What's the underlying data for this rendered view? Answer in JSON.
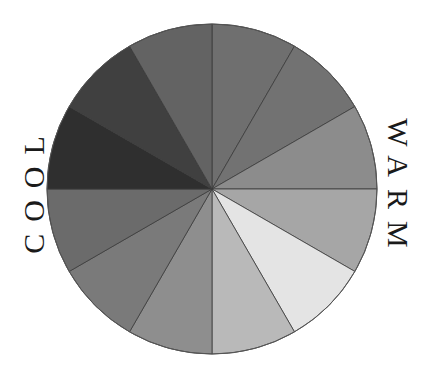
{
  "diagram": {
    "type": "color-wheel",
    "center": [
      212,
      189
    ],
    "radius": 165,
    "segment_count": 12,
    "stroke_color": "#3a3a3a",
    "segments": [
      {
        "index": 0,
        "start_deg": 0,
        "end_deg": 30,
        "color": "#6f6f6f"
      },
      {
        "index": 1,
        "start_deg": 30,
        "end_deg": 60,
        "color": "#727272"
      },
      {
        "index": 2,
        "start_deg": 60,
        "end_deg": 90,
        "color": "#8c8c8c"
      },
      {
        "index": 3,
        "start_deg": 90,
        "end_deg": 120,
        "color": "#a6a6a6"
      },
      {
        "index": 4,
        "start_deg": 120,
        "end_deg": 150,
        "color": "#e4e4e4"
      },
      {
        "index": 5,
        "start_deg": 150,
        "end_deg": 180,
        "color": "#b9b9b9"
      },
      {
        "index": 6,
        "start_deg": 180,
        "end_deg": 210,
        "color": "#8e8e8e"
      },
      {
        "index": 7,
        "start_deg": 210,
        "end_deg": 240,
        "color": "#7a7a7a"
      },
      {
        "index": 8,
        "start_deg": 240,
        "end_deg": 270,
        "color": "#6b6b6b"
      },
      {
        "index": 9,
        "start_deg": 270,
        "end_deg": 300,
        "color": "#2f2f2f"
      },
      {
        "index": 10,
        "start_deg": 300,
        "end_deg": 330,
        "color": "#404040"
      },
      {
        "index": 11,
        "start_deg": 330,
        "end_deg": 360,
        "color": "#636363"
      }
    ]
  },
  "labels": {
    "warm": "WARM",
    "cool": "COOL"
  }
}
